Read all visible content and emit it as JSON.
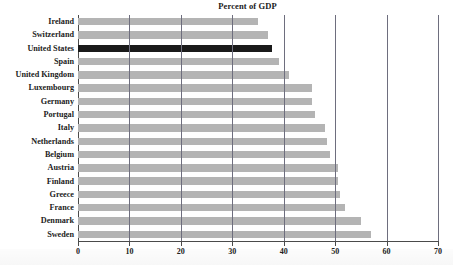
{
  "chart_data": {
    "type": "bar",
    "orientation": "horizontal",
    "title": "Percent of GDP",
    "xlabel": "",
    "ylabel": "",
    "xlim": [
      0,
      70
    ],
    "xticks": [
      0,
      10,
      20,
      30,
      40,
      50,
      60,
      70
    ],
    "xtick_labels": [
      "0",
      "10",
      "20",
      "30",
      "40",
      "50",
      "60",
      "70"
    ],
    "grid": true,
    "grid_axis": "x",
    "legend": null,
    "categories": [
      "Ireland",
      "Switzerland",
      "United States",
      "Spain",
      "United Kingdom",
      "Luxembourg",
      "Germany",
      "Portugal",
      "Italy",
      "Netherlands",
      "Belgium",
      "Austria",
      "Finland",
      "Greece",
      "France",
      "Denmark",
      "Sweden"
    ],
    "values": [
      35,
      37,
      37.7,
      39,
      41,
      45.5,
      45.5,
      46,
      48,
      48.5,
      49,
      50.5,
      50.5,
      51,
      52,
      55,
      57
    ],
    "highlight_category": "United States",
    "colors": {
      "bar": "#b4b4b4",
      "highlight_bar": "#1a1a1a",
      "gridline": "#6e6e7e",
      "axis": "#4b4b4b",
      "text": "#1c1c1c",
      "background": "#ffffff"
    }
  }
}
